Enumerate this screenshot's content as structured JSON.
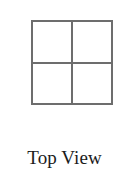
{
  "figure": {
    "caption": "Top View",
    "diagram": {
      "shape": "square",
      "subdivision": "2x2 grid",
      "cells": [
        {
          "id": "top-left",
          "label": ""
        },
        {
          "id": "top-right",
          "label": ""
        },
        {
          "id": "bottom-left",
          "label": ""
        },
        {
          "id": "bottom-right",
          "label": ""
        }
      ],
      "line_color": "#6d6d6d",
      "fill_color": "#ffffff"
    },
    "text_color": "#1b1b1b",
    "background_color": "#ffffff"
  }
}
